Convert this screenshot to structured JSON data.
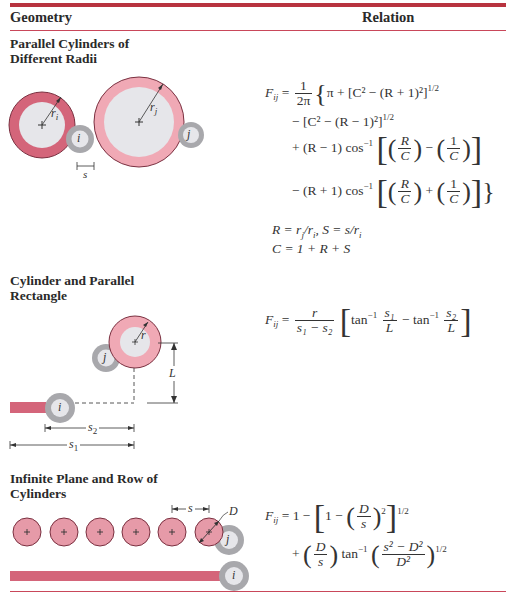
{
  "header": {
    "geometry_label": "Geometry",
    "relation_label": "Relation"
  },
  "colors": {
    "accent_red": "#b8333f",
    "cylinder_i_dark": "#d4657a",
    "cylinder_j_light": "#f0a9b5",
    "cylinder_core": "#e6e6ea",
    "small_cylinder_ring": "#a8a8ac"
  },
  "sections": [
    {
      "title_line1": "Parallel Cylinders of",
      "title_line2": "Different Radii",
      "labels": {
        "ri": "r",
        "ri_sub": "i",
        "rj": "r",
        "rj_sub": "j",
        "i": "i",
        "j": "j",
        "s": "s"
      },
      "relation": {
        "lhs": "F",
        "lhs_sub": "ij",
        "frac_num": "1",
        "frac_den": "2π",
        "line1": "π + [C² − (R + 1)²]",
        "line1_exp": "1/2",
        "line2": "− [C² − (R − 1)²]",
        "line2_exp": "1/2",
        "line3_prefix": "+ (R − 1) cos",
        "line3_op": "−",
        "line4_prefix": "− (R + 1) cos",
        "line4_op": "+",
        "frac_R": "R",
        "frac_C": "C",
        "frac_1": "1",
        "inv": "−1",
        "def1": "R = r",
        "def1_sub1": "j",
        "def1_mid": "/r",
        "def1_sub2": "i",
        "def1_tail": ", S = s/r",
        "def1_sub3": "i",
        "def2": "C = 1 + R + S"
      }
    },
    {
      "title_line1": "Cylinder and Parallel",
      "title_line2": "Rectangle",
      "labels": {
        "r": "r",
        "j": "j",
        "i": "i",
        "L": "L",
        "s2": "s",
        "s2_sub": "2",
        "s1": "s",
        "s1_sub": "1"
      },
      "relation": {
        "lhs": "F",
        "lhs_sub": "ij",
        "num": "r",
        "den": "s₁ − s₂",
        "tan": "tan",
        "inv": "−1",
        "t1_num": "s₁",
        "t1_den": "L",
        "minus": "−",
        "t2_num": "s₂",
        "t2_den": "L"
      }
    },
    {
      "title_line1": "Infinite Plane and Row of",
      "title_line2": "Cylinders",
      "labels": {
        "s": "s",
        "D": "D",
        "j": "j",
        "i": "i",
        "plus": "+"
      },
      "relation": {
        "lhs": "F",
        "lhs_sub": "ij",
        "eq": "= 1 −",
        "one_minus": "1 −",
        "D": "D",
        "s": "s",
        "sq": "2",
        "exp": "1/2",
        "plus": "+",
        "tan": "tan",
        "inv": "−1",
        "num2": "s² − D²",
        "den2": "D²"
      }
    }
  ]
}
